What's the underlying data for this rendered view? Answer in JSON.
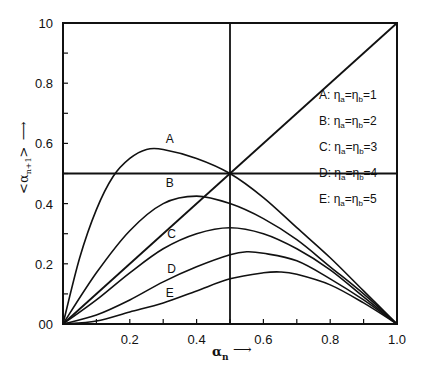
{
  "chart_data": {
    "type": "line",
    "title": "",
    "xlabel": "α_n ⟶",
    "ylabel": "<α_{n+1}> ⟶",
    "xlim": [
      0,
      1.0
    ],
    "ylim": [
      0,
      1.0
    ],
    "x_ticks": [
      {
        "value": 0.2,
        "label": "0.2"
      },
      {
        "value": 0.4,
        "label": "0.4"
      },
      {
        "value": 0.6,
        "label": "0.6"
      },
      {
        "value": 0.8,
        "label": "0.8"
      },
      {
        "value": 1.0,
        "label": "1.0"
      }
    ],
    "y_ticks": [
      {
        "value": 0.0,
        "label": "00"
      },
      {
        "value": 0.2,
        "label": "0.2"
      },
      {
        "value": 0.4,
        "label": "0.4"
      },
      {
        "value": 0.6,
        "label": "0.6"
      },
      {
        "value": 0.8,
        "label": "0.8"
      },
      {
        "value": 1.0,
        "label": "10"
      }
    ],
    "minor_tick_step": 0.1,
    "grid": false,
    "reference_lines": [
      {
        "type": "diagonal",
        "from": [
          0,
          0
        ],
        "to": [
          1,
          1
        ],
        "desc": "α_{n+1} = α_n"
      },
      {
        "type": "horizontal",
        "y": 0.5
      },
      {
        "type": "vertical",
        "x": 0.5
      }
    ],
    "legend_position": "right-inside",
    "series": [
      {
        "name": "A",
        "legend": "A: η_a=η_b=1",
        "label_at": [
          0.32,
          0.6
        ],
        "x": [
          0,
          0.05,
          0.1,
          0.15,
          0.2,
          0.25,
          0.3,
          0.4,
          0.5,
          0.6,
          0.7,
          0.8,
          0.9,
          1.0
        ],
        "values": [
          0,
          0.22,
          0.38,
          0.49,
          0.55,
          0.58,
          0.58,
          0.55,
          0.5,
          0.42,
          0.32,
          0.22,
          0.11,
          0
        ]
      },
      {
        "name": "B",
        "legend": "B: η_a=η_b=2",
        "label_at": [
          0.32,
          0.455
        ],
        "x": [
          0,
          0.1,
          0.2,
          0.3,
          0.4,
          0.5,
          0.6,
          0.7,
          0.8,
          0.9,
          1.0
        ],
        "values": [
          0,
          0.17,
          0.31,
          0.4,
          0.425,
          0.4,
          0.35,
          0.28,
          0.19,
          0.1,
          0
        ]
      },
      {
        "name": "C",
        "legend": "C: η_a=η_b=3",
        "label_at": [
          0.325,
          0.285
        ],
        "x": [
          0,
          0.1,
          0.2,
          0.3,
          0.4,
          0.5,
          0.6,
          0.7,
          0.8,
          0.9,
          1.0
        ],
        "values": [
          0,
          0.08,
          0.17,
          0.25,
          0.3,
          0.32,
          0.3,
          0.25,
          0.18,
          0.09,
          0
        ]
      },
      {
        "name": "D",
        "legend": "D: η_a=η_b=4",
        "label_at": [
          0.325,
          0.17
        ],
        "x": [
          0,
          0.1,
          0.2,
          0.3,
          0.4,
          0.5,
          0.55,
          0.6,
          0.7,
          0.8,
          0.9,
          1.0
        ],
        "values": [
          0,
          0.03,
          0.08,
          0.14,
          0.19,
          0.23,
          0.24,
          0.235,
          0.21,
          0.15,
          0.08,
          0
        ]
      },
      {
        "name": "E",
        "legend": "E: η_a=η_b=5",
        "label_at": [
          0.32,
          0.09
        ],
        "x": [
          0,
          0.1,
          0.2,
          0.3,
          0.4,
          0.5,
          0.6,
          0.65,
          0.7,
          0.8,
          0.9,
          1.0
        ],
        "values": [
          0,
          0.01,
          0.04,
          0.07,
          0.11,
          0.15,
          0.17,
          0.173,
          0.165,
          0.13,
          0.07,
          0
        ]
      }
    ]
  },
  "legend": {
    "items": [
      {
        "letter": "A",
        "text": "A: η",
        "sub1": "a",
        "mid": "=η",
        "sub2": "b",
        "tail": "=1"
      },
      {
        "letter": "B",
        "text": "B: η",
        "sub1": "a",
        "mid": "=η",
        "sub2": "b",
        "tail": "=2"
      },
      {
        "letter": "C",
        "text": "C: η",
        "sub1": "a",
        "mid": "=η",
        "sub2": "b",
        "tail": "=3"
      },
      {
        "letter": "D",
        "text": "D: η",
        "sub1": "a",
        "mid": "=η",
        "sub2": "b",
        "tail": "=4"
      },
      {
        "letter": "E",
        "text": "E: η",
        "sub1": "a",
        "mid": "=η",
        "sub2": "b",
        "tail": "=5"
      }
    ]
  },
  "axes": {
    "x_title_main": "α",
    "x_title_sub": "n",
    "x_arrow": "⟶",
    "y_title_main": "<α",
    "y_title_sub": "n+1",
    "y_title_close": ">",
    "y_arrow": "⟶"
  }
}
